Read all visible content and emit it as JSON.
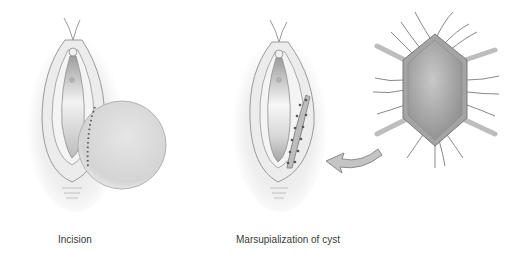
{
  "figure": {
    "panels": [
      {
        "id": "incision",
        "caption": "Incision"
      },
      {
        "id": "marsupialization",
        "caption": "Marsupialization of cyst"
      }
    ],
    "colors": {
      "background": "#ffffff",
      "outline": "#9a9a9a",
      "cyst_fill": "#d6d6d6",
      "cyst_dark": "#a8a8a8",
      "suture": "#555555",
      "arrow_fill": "#c4c4c4",
      "caption_text": "#3a3a3a"
    },
    "icons": {
      "arrow": "curved-arrow-left",
      "detail": "sutured-cyst-wall-detail"
    }
  }
}
